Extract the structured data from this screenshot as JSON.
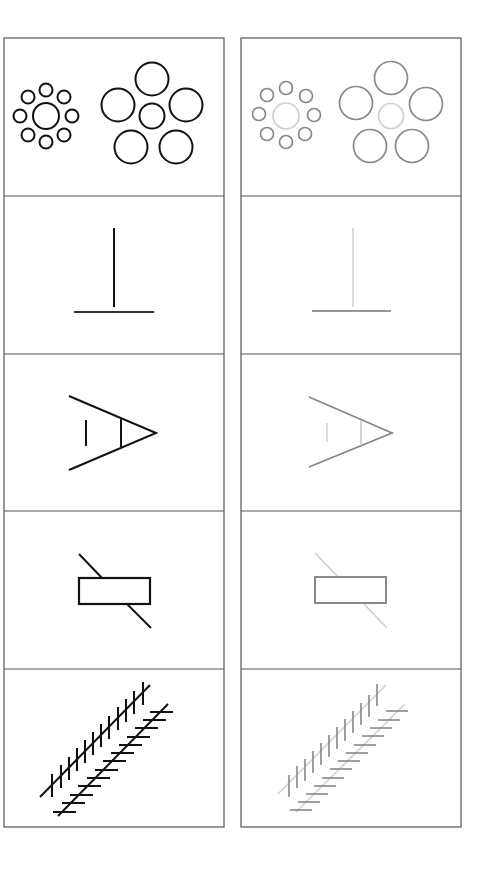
{
  "figure": {
    "title": "",
    "columns": [
      {
        "id": "original",
        "stroke": "#111111",
        "frame": "#555555"
      },
      {
        "id": "greyed",
        "stroke": "#888888",
        "highlight": "#cccccc",
        "frame": "#555555"
      }
    ],
    "rows": [
      {
        "id": "ebbinghaus",
        "name": "Ebbinghaus illusion"
      },
      {
        "id": "vertical-horizontal",
        "name": "Vertical-horizontal illusion"
      },
      {
        "id": "ponzo-angle",
        "name": "Angle illusion"
      },
      {
        "id": "poggendorff",
        "name": "Poggendorff illusion"
      },
      {
        "id": "zollner",
        "name": "Zollner illusion"
      }
    ]
  }
}
